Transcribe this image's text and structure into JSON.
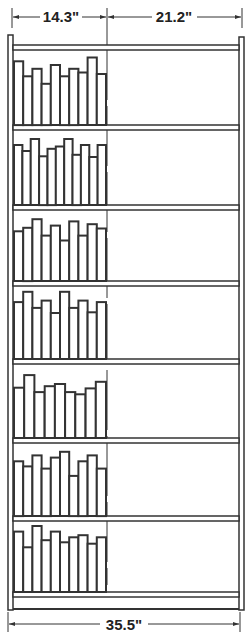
{
  "diagram": {
    "dimensions": {
      "occupied_width": "14.3\"",
      "open_width": "21.2\"",
      "total_width": "35.5\""
    },
    "shelf_count": 7,
    "shelves": [
      {
        "label": "shelf-1",
        "book_heights": [
          0.85,
          0.65,
          0.75,
          0.55,
          0.8,
          0.65,
          0.75,
          0.7,
          0.9,
          0.68
        ]
      },
      {
        "label": "shelf-2",
        "book_heights": [
          0.8,
          0.72,
          0.88,
          0.65,
          0.75,
          0.78,
          0.88,
          0.67,
          0.8,
          0.64,
          0.8
        ]
      },
      {
        "label": "shelf-3",
        "book_heights": [
          0.7,
          0.75,
          0.87,
          0.64,
          0.78,
          0.57,
          0.84,
          0.64,
          0.8,
          0.74
        ]
      },
      {
        "label": "shelf-4",
        "book_heights": [
          0.78,
          0.92,
          0.7,
          0.8,
          0.63,
          0.92,
          0.7,
          0.8,
          0.64,
          0.78
        ]
      },
      {
        "label": "shelf-5",
        "book_heights": [
          0.68,
          0.85,
          0.62,
          0.7,
          0.73,
          0.62,
          0.59,
          0.67,
          0.76
        ]
      },
      {
        "label": "shelf-6",
        "book_heights": [
          0.75,
          0.68,
          0.83,
          0.65,
          0.8,
          0.88,
          0.55,
          0.75,
          0.83,
          0.65
        ]
      },
      {
        "label": "shelf-7",
        "book_heights": [
          0.85,
          0.63,
          0.93,
          0.73,
          0.85,
          0.7,
          0.77,
          0.8,
          0.68,
          0.77
        ]
      }
    ]
  }
}
